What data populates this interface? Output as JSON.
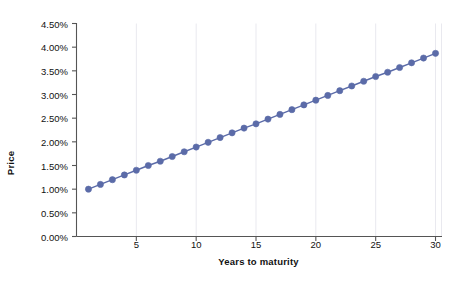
{
  "chart_data": {
    "type": "line",
    "title": "",
    "xlabel": "Years to maturity",
    "ylabel": "Price",
    "x": [
      1,
      2,
      3,
      4,
      5,
      6,
      7,
      8,
      9,
      10,
      11,
      12,
      13,
      14,
      15,
      16,
      17,
      18,
      19,
      20,
      21,
      22,
      23,
      24,
      25,
      26,
      27,
      28,
      29,
      30
    ],
    "values": [
      1.0,
      1.1,
      1.2,
      1.3,
      1.4,
      1.5,
      1.59,
      1.69,
      1.79,
      1.89,
      1.99,
      2.09,
      2.19,
      2.29,
      2.38,
      2.48,
      2.58,
      2.68,
      2.78,
      2.88,
      2.98,
      3.08,
      3.18,
      3.28,
      3.38,
      3.47,
      3.57,
      3.67,
      3.77,
      3.87
    ],
    "series": [
      {
        "name": "Price",
        "values": [
          1.0,
          1.1,
          1.2,
          1.3,
          1.4,
          1.5,
          1.59,
          1.69,
          1.79,
          1.89,
          1.99,
          2.09,
          2.19,
          2.29,
          2.38,
          2.48,
          2.58,
          2.68,
          2.78,
          2.88,
          2.98,
          3.08,
          3.18,
          3.28,
          3.38,
          3.47,
          3.57,
          3.67,
          3.77,
          3.87
        ],
        "color": "#5b6ba8",
        "marker": "circle"
      }
    ],
    "value_unit": "%",
    "xlim": [
      0,
      30.5
    ],
    "ylim": [
      0,
      4.5
    ],
    "ytick_values": [
      0.0,
      0.5,
      1.0,
      1.5,
      2.0,
      2.5,
      3.0,
      3.5,
      4.0,
      4.5
    ],
    "ytick_labels": [
      "0.00%",
      "0.50%",
      "1.00%",
      "1.50%",
      "2.00%",
      "2.50%",
      "3.00%",
      "3.50%",
      "4.00%",
      "4.50%"
    ],
    "xtick_values": [
      5,
      10,
      15,
      20,
      25,
      30
    ],
    "xtick_labels": [
      "5",
      "10",
      "15",
      "20",
      "25",
      "30"
    ],
    "grid": {
      "vertical": true,
      "horizontal": false,
      "vertical_step": 5,
      "color": "#e9e9ef"
    },
    "legend": {
      "visible": false,
      "position": "none"
    },
    "axis_color": "#555555",
    "background": "#ffffff",
    "plot_background": "#ffffff"
  }
}
